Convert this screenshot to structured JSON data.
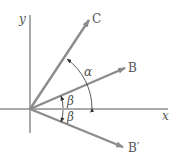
{
  "diagram": {
    "type": "vector-angle-diagram",
    "axes": {
      "x_label": "x",
      "y_label": "y",
      "origin": [
        30,
        109
      ]
    },
    "vectors": [
      {
        "name": "C",
        "label": "C",
        "tip": [
          89,
          20
        ]
      },
      {
        "name": "B",
        "label": "B",
        "tip": [
          125,
          68
        ]
      },
      {
        "name": "B-prime",
        "label": "B′",
        "tip": [
          123,
          147
        ]
      }
    ],
    "angles": [
      {
        "symbol": "α",
        "description": "angle between x-axis and C"
      },
      {
        "symbol": "β",
        "description": "angle between x-axis and B"
      },
      {
        "symbol": "β",
        "description": "angle between x-axis and B′"
      }
    ],
    "colors": {
      "vector": "#8c8c8c",
      "axis": "#555555",
      "arc": "#333333",
      "text": "#555555"
    }
  }
}
